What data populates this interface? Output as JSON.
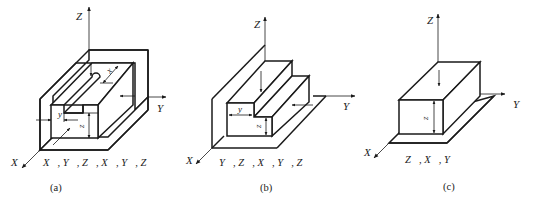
{
  "figure": {
    "panels": [
      {
        "id": "a",
        "caption": "(a)",
        "axes": {
          "z": "Z",
          "y": "Y",
          "x": "X"
        },
        "dimensions": {
          "slot_width": "y",
          "height": "z",
          "depth": "x"
        },
        "constraints": "X⃗, Y⃗, Z⃗, X⃗, Y⃗, Z⃗",
        "constraint_list": [
          "X",
          "Y",
          "Z",
          "X",
          "Y",
          "Z"
        ]
      },
      {
        "id": "b",
        "caption": "(b)",
        "axes": {
          "z": "Z",
          "y": "Y",
          "x": "X"
        },
        "dimensions": {
          "step_width": "y",
          "height": "z"
        },
        "constraints": "Y⃗, Z⃗, X⃗, Y⃗, Z⃗",
        "constraint_list": [
          "Y",
          "Z",
          "X",
          "Y",
          "Z"
        ]
      },
      {
        "id": "c",
        "caption": "(c)",
        "axes": {
          "z": "Z",
          "y": "Y",
          "x": "X"
        },
        "dimensions": {
          "height": "z"
        },
        "constraints": "Z⃗, X⃗, Y⃗",
        "constraint_list": [
          "Z",
          "X",
          "Y"
        ]
      }
    ]
  }
}
